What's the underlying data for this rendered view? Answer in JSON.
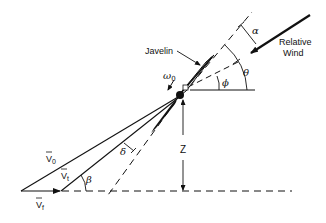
{
  "diagram": {
    "type": "javelin flight geometry",
    "labels": {
      "javelin": "Javelin",
      "relative_wind_line1": "Relative",
      "relative_wind_line2": "Wind",
      "alpha": "α",
      "theta": "θ",
      "phi": "ϕ",
      "omega": "ω",
      "omega_sub": "0",
      "delta": "δ",
      "beta": "β",
      "z": "Z",
      "v0": "V",
      "v0_sub": "0",
      "vt": "V",
      "vt_sub": "t",
      "vf": "V",
      "vf_sub": "f"
    },
    "colors": {
      "stroke": "#111111",
      "background": "#ffffff"
    }
  }
}
